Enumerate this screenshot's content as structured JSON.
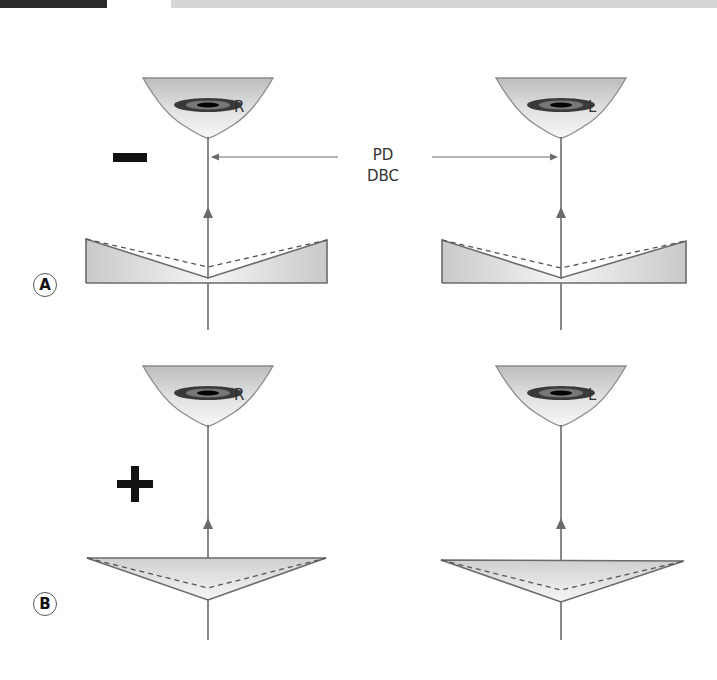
{
  "figure": {
    "panels": [
      {
        "id": "A",
        "label": "A",
        "sign": "−",
        "lens_type": "minus (concave)",
        "right_eye": "R",
        "left_eye": "L"
      },
      {
        "id": "B",
        "label": "B",
        "sign": "+",
        "lens_type": "plus (convex)",
        "right_eye": "R",
        "left_eye": "L"
      }
    ],
    "pd_label": "PD",
    "dbc_label": "DBC",
    "colors": {
      "line": "#6b6b6b",
      "lens_fill": "#d4d4d4",
      "sign": "#111111",
      "header_dark": "#2a2a2a",
      "header_light": "#d6d6d6"
    }
  }
}
